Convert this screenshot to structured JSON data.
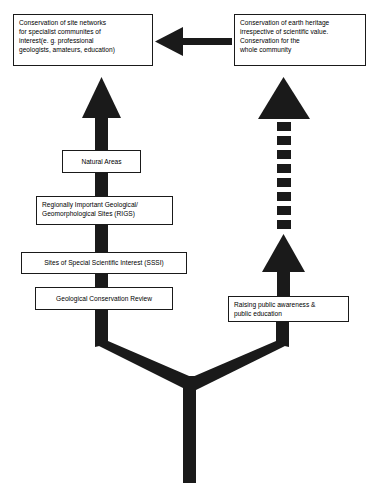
{
  "diagram": {
    "ink_color": "#1a1a1a",
    "background_color": "#ffffff",
    "nodes": {
      "specialist_networks": {
        "label": "Conservation of site networks\nfor specialist communites of\ninterest(e. g. professional\ngeologists, amateurs, education)"
      },
      "earth_heritage": {
        "label": "Conservation of earth heritage\nirrespective of scientific value.\nConservation for the\nwhole community"
      },
      "natural_areas": {
        "label": "Natural Areas"
      },
      "rigs": {
        "label": "Regionally Important Geological/\nGeomorphological Sites (RIGS)"
      },
      "sssi": {
        "label": "Sites of Special Scientific Interest (SSSI)"
      },
      "gcr": {
        "label": "Geological Conservation Review"
      },
      "public_awareness": {
        "label": "Raising public awareness &\npublic education"
      }
    },
    "connectors": {
      "cross_arrow": {
        "name": "earth-heritage-to-specialist-arrow",
        "direction": "left",
        "style": "solid"
      },
      "left_column_arrow": {
        "name": "specialist-column-up-arrow",
        "direction": "up",
        "style": "solid"
      },
      "right_column_upper_arrow": {
        "name": "earth-heritage-column-up-arrow",
        "direction": "up",
        "style": "dashed",
        "dash_count": 8
      },
      "right_column_lower_arrow": {
        "name": "public-awareness-up-arrow",
        "direction": "up",
        "style": "solid"
      },
      "trunk": {
        "name": "y-junction-trunk",
        "style": "solid"
      }
    }
  }
}
